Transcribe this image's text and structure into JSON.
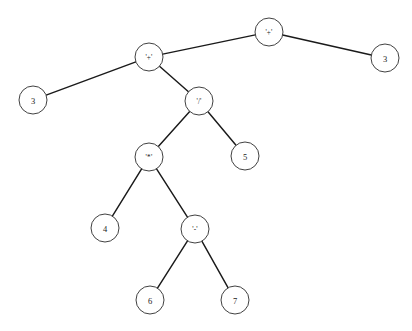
{
  "figure": {
    "kind": "binary-expression-tree",
    "width": 412,
    "height": 331,
    "background_color": "#ffffff",
    "edge_color": "#1a1a1a",
    "node_fill_color": "#ffffff",
    "node_stroke_color": "#2b2b2b",
    "label_color": "#1a1a1a",
    "node_radius": 14,
    "caption": ""
  },
  "nodes": [
    {
      "id": "n0",
      "label": "'+'",
      "kind": "operator",
      "x": 269,
      "y": 32,
      "depth": 0
    },
    {
      "id": "n1",
      "label": "'+'",
      "kind": "operator",
      "x": 149,
      "y": 57,
      "depth": 1
    },
    {
      "id": "n2",
      "label": "3",
      "kind": "operand",
      "x": 385,
      "y": 58,
      "depth": 1
    },
    {
      "id": "n3",
      "label": "3",
      "kind": "operand",
      "x": 33,
      "y": 100,
      "depth": 2
    },
    {
      "id": "n4",
      "label": "'/'",
      "kind": "operator",
      "x": 199,
      "y": 101,
      "depth": 2
    },
    {
      "id": "n5",
      "label": "'*'",
      "kind": "operator",
      "x": 149,
      "y": 157,
      "depth": 3
    },
    {
      "id": "n6",
      "label": "5",
      "kind": "operand",
      "x": 245,
      "y": 156,
      "depth": 3
    },
    {
      "id": "n7",
      "label": "4",
      "kind": "operand",
      "x": 105,
      "y": 228,
      "depth": 4
    },
    {
      "id": "n8",
      "label": "'-'",
      "kind": "operator",
      "x": 195,
      "y": 229,
      "depth": 4
    },
    {
      "id": "n9",
      "label": "6",
      "kind": "operand",
      "x": 150,
      "y": 300,
      "depth": 5
    },
    {
      "id": "n10",
      "label": "7",
      "kind": "operand",
      "x": 235,
      "y": 300,
      "depth": 5
    }
  ],
  "edges": [
    {
      "from": "n0",
      "to": "n1",
      "side": "left"
    },
    {
      "from": "n0",
      "to": "n2",
      "side": "right"
    },
    {
      "from": "n1",
      "to": "n3",
      "side": "left"
    },
    {
      "from": "n1",
      "to": "n4",
      "side": "right"
    },
    {
      "from": "n4",
      "to": "n5",
      "side": "left"
    },
    {
      "from": "n4",
      "to": "n6",
      "side": "right"
    },
    {
      "from": "n5",
      "to": "n7",
      "side": "left"
    },
    {
      "from": "n5",
      "to": "n8",
      "side": "right"
    },
    {
      "from": "n8",
      "to": "n9",
      "side": "left"
    },
    {
      "from": "n8",
      "to": "n10",
      "side": "right"
    }
  ]
}
